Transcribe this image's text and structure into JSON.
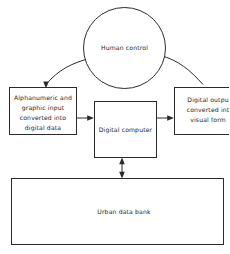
{
  "diagram": {
    "background_color": "#ffffff",
    "line_color": "#2b2b2b",
    "text_color": "#1c1c1c",
    "nodes": {
      "human_control": {
        "label": "Human control",
        "shape": "ellipse"
      },
      "input": {
        "shape": "rectangle",
        "line1": "Alphanumeric and",
        "line2": "graphic input",
        "line3": "converted into",
        "line4": "digital data"
      },
      "computer": {
        "label": "Digital computer",
        "shape": "rectangle"
      },
      "output": {
        "shape": "rectangle",
        "line1": "Digital outpu",
        "line2": "converted int",
        "line3": "visual form"
      },
      "data_bank": {
        "label": "Urban data bank",
        "shape": "rectangle"
      }
    },
    "edges": [
      {
        "name": "human-to-input",
        "style": "curved",
        "arrows": "end"
      },
      {
        "name": "input-to-computer",
        "style": "straight",
        "arrows": "end"
      },
      {
        "name": "computer-to-output",
        "style": "straight",
        "arrows": "end"
      },
      {
        "name": "output-to-human",
        "style": "curved",
        "arrows": "end"
      },
      {
        "name": "computer-to-data-bank",
        "style": "straight",
        "arrows": "both"
      }
    ]
  }
}
